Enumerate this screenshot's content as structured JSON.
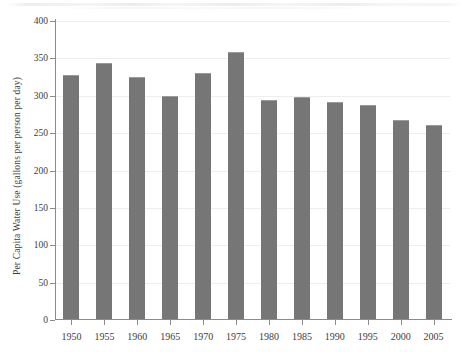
{
  "chart_data": {
    "type": "bar",
    "title": "",
    "xlabel": "",
    "ylabel": "Per Capita Water Use (gallons per person per day)",
    "categories": [
      "1950",
      "1955",
      "1960",
      "1965",
      "1970",
      "1975",
      "1980",
      "1985",
      "1990",
      "1995",
      "2000",
      "2005"
    ],
    "values": [
      328,
      344,
      325,
      300,
      330,
      359,
      295,
      299,
      292,
      287,
      267,
      261
    ],
    "ylim": [
      0,
      400
    ],
    "ytick_labels": [
      "0",
      "50",
      "100",
      "150",
      "200",
      "250",
      "300",
      "350",
      "400"
    ],
    "ytick_values": [
      0,
      50,
      100,
      150,
      200,
      250,
      300,
      350,
      400
    ],
    "grid": true,
    "legend": false,
    "bar_color": "#767676",
    "grid_color": "#eeeef1",
    "axis_color": "#8b8b8b",
    "text_color": "#3d3d3d",
    "background": "#ffffff"
  }
}
